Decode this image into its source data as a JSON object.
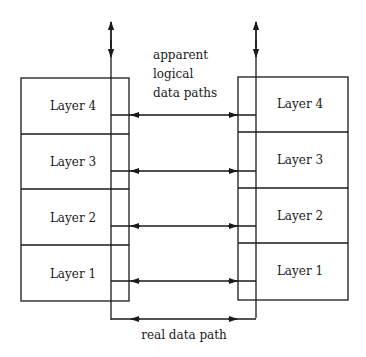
{
  "diagram": {
    "type": "layered protocol stack communication",
    "left_stack": {
      "layers": [
        "Layer 4",
        "Layer 3",
        "Layer 2",
        "Layer 1"
      ]
    },
    "right_stack": {
      "layers": [
        "Layer 4",
        "Layer 3",
        "Layer 2",
        "Layer 1"
      ]
    },
    "annotations": {
      "logical_label_line1": "apparent",
      "logical_label_line2": "logical",
      "logical_label_line3": "data paths",
      "real_label": "real data path"
    },
    "connections": [
      {
        "from": "left.Layer 4",
        "to": "right.Layer 4",
        "kind": "logical",
        "bidirectional": true
      },
      {
        "from": "left.Layer 3",
        "to": "right.Layer 3",
        "kind": "logical",
        "bidirectional": true
      },
      {
        "from": "left.Layer 2",
        "to": "right.Layer 2",
        "kind": "logical",
        "bidirectional": true
      },
      {
        "from": "left.Layer 1",
        "to": "right.Layer 1",
        "kind": "logical",
        "bidirectional": true
      },
      {
        "from": "left.bottom",
        "to": "right.bottom",
        "kind": "real",
        "bidirectional": true
      }
    ],
    "colors": {
      "line": "#1a1a1a",
      "background": "#ffffff"
    }
  }
}
